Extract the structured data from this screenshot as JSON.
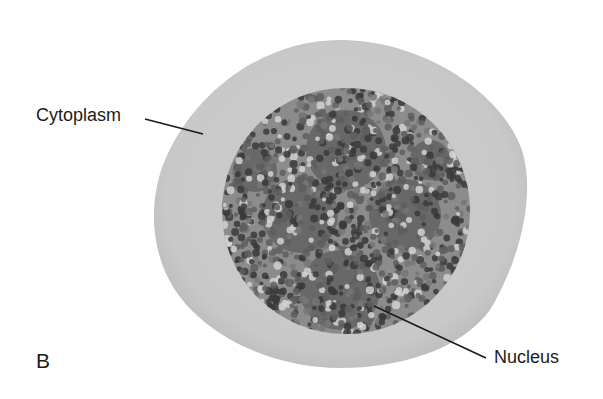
{
  "figure": {
    "panel_letter": "B"
  },
  "labels": {
    "cytoplasm": "Cytoplasm",
    "nucleus": "Nucleus"
  },
  "colors": {
    "background": "#ffffff",
    "cytoplasm_fill": "#c9c9c9",
    "cytoplasm_edge": "#b8b8b8",
    "nucleus_base": "#8a8a8a",
    "chromatin_dark": "#3a3a3a",
    "chromatin_mid": "#5e5e5e",
    "chromatin_light": "#d2d2d2",
    "leader_line": "#1a1a1a",
    "text": "#1c1c1c"
  }
}
